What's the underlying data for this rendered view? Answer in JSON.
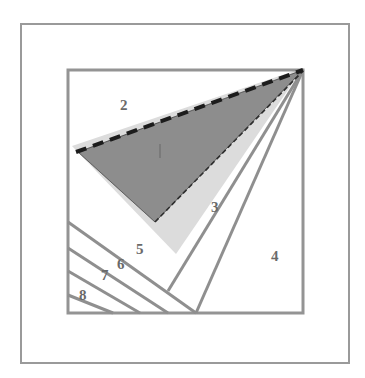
{
  "figure": {
    "background_color": "#ffffff",
    "outer_frame": {
      "name": "outer-border-frame",
      "x": 21,
      "y": 24,
      "width": 328,
      "height": 339,
      "stroke_color": "#9a9a9a",
      "stroke_width": 2,
      "fill": "none"
    },
    "inner_square": {
      "name": "inner-square",
      "x": 68,
      "y": 70,
      "width": 235,
      "height": 243,
      "stroke_color": "#949494",
      "stroke_width": 3,
      "fill": "none"
    },
    "apex_point": {
      "x": 303,
      "y": 70
    },
    "shapes": [
      {
        "name": "light-gray-wedge",
        "type": "polygon",
        "fill_color": "#dcdcdc",
        "points": "72,146 303,68 176,254"
      },
      {
        "name": "dark-gray-triangle",
        "type": "polygon",
        "fill_color": "#8d8d8d",
        "stroke_color": "#4a4a4a",
        "stroke_dash": "1,0",
        "points": "78,152 303,70 155,222"
      },
      {
        "name": "dashed-top-edge",
        "type": "polyline",
        "stroke_color": "#1c1c1c",
        "stroke_width": 4,
        "stroke_dash": "11,7",
        "points": "76,152 303,70"
      },
      {
        "name": "dashed-lower-edge",
        "type": "polyline",
        "stroke_color": "#2e2e2e",
        "stroke_width": 1.6,
        "stroke_dash": "5,3",
        "points": "155,222 303,71"
      },
      {
        "name": "wedge-divider-line-a",
        "type": "polyline",
        "stroke_color": "#8f8f8f",
        "stroke_width": 3,
        "points": "303,70 196,313"
      },
      {
        "name": "wedge-divider-line-b",
        "type": "polyline",
        "stroke_color": "#8f8f8f",
        "stroke_width": 3,
        "points": "303,70 168,291"
      },
      {
        "name": "hatch-line-1",
        "type": "polyline",
        "stroke_color": "#8f8f8f",
        "stroke_width": 3,
        "points": "68,222 196,313"
      },
      {
        "name": "hatch-line-2",
        "type": "polyline",
        "stroke_color": "#8f8f8f",
        "stroke_width": 3,
        "points": "68,248 168,313"
      },
      {
        "name": "hatch-line-3",
        "type": "polyline",
        "stroke_color": "#8f8f8f",
        "stroke_width": 3,
        "points": "68,271 140,313"
      },
      {
        "name": "hatch-line-4",
        "type": "polyline",
        "stroke_color": "#8f8f8f",
        "stroke_width": 3,
        "points": "68,295 113,313"
      },
      {
        "name": "center-tick-mark",
        "type": "polyline",
        "stroke_color": "#6e6e6e",
        "stroke_width": 1.2,
        "points": "160,144 160,158"
      }
    ],
    "labels": [
      {
        "id": "label-2",
        "text": "2",
        "x": 120,
        "y": 110
      },
      {
        "id": "label-3",
        "text": "3",
        "x": 211,
        "y": 212
      },
      {
        "id": "label-4",
        "text": "4",
        "x": 271,
        "y": 261
      },
      {
        "id": "label-5",
        "text": "5",
        "x": 136,
        "y": 254
      },
      {
        "id": "label-6",
        "text": "6",
        "x": 117,
        "y": 269
      },
      {
        "id": "label-7",
        "text": "7",
        "x": 101,
        "y": 280
      },
      {
        "id": "label-8",
        "text": "8",
        "x": 79,
        "y": 300
      }
    ],
    "colors": {
      "outer_frame": "#9a9a9a",
      "inner_square": "#949494",
      "dark_region": "#8d8d8d",
      "light_region": "#dcdcdc",
      "line_gray": "#8f8f8f",
      "dash_black": "#1c1c1c",
      "label_gray": "#6a6a6a",
      "page_background": "#ffffff"
    }
  }
}
